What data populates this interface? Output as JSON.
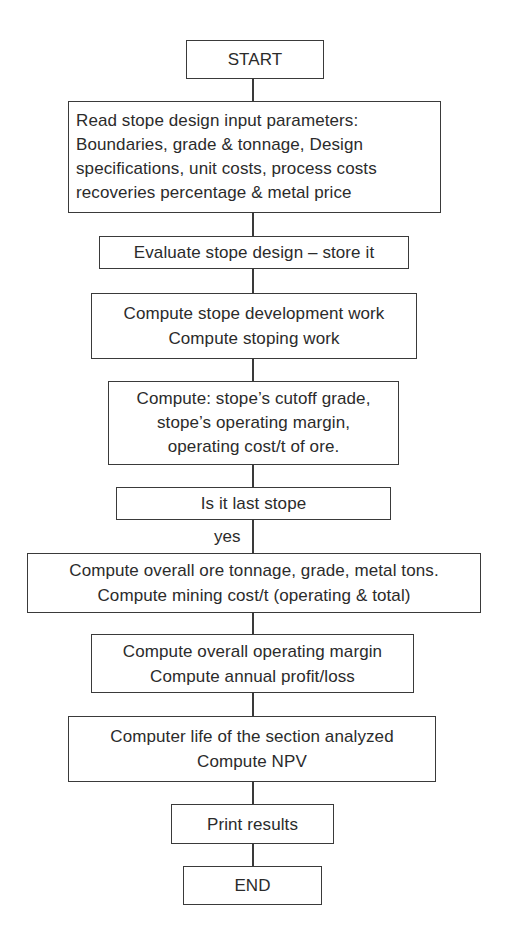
{
  "flowchart": {
    "start": {
      "label": "START"
    },
    "read_params": {
      "lines": [
        "Read stope design input parameters:",
        "Boundaries, grade & tonnage, Design",
        "specifications, unit costs, process costs",
        "recoveries percentage & metal price"
      ]
    },
    "evaluate": {
      "lines": [
        "Evaluate stope design – store it"
      ]
    },
    "compute_work": {
      "lines": [
        "Compute stope development work",
        "Compute stoping work"
      ]
    },
    "compute_cutoff": {
      "lines": [
        "Compute: stope’s cutoff grade,",
        "stope’s operating margin,",
        "operating cost/t  of ore."
      ]
    },
    "decision": {
      "lines": [
        "Is it last stope"
      ]
    },
    "decision_branch_label": "yes",
    "compute_overall": {
      "lines": [
        "Compute overall ore tonnage, grade, metal tons.",
        "Compute mining cost/t (operating & total)"
      ]
    },
    "compute_margin": {
      "lines": [
        "Compute overall operating margin",
        "Compute annual profit/loss"
      ]
    },
    "compute_npv": {
      "lines": [
        "Computer life of the section analyzed",
        "Compute NPV"
      ]
    },
    "print": {
      "label": "Print results"
    },
    "end": {
      "label": "END"
    }
  },
  "colors": {
    "stroke": "#3a3a3a",
    "text": "#2b2b2b",
    "background": "#ffffff"
  }
}
